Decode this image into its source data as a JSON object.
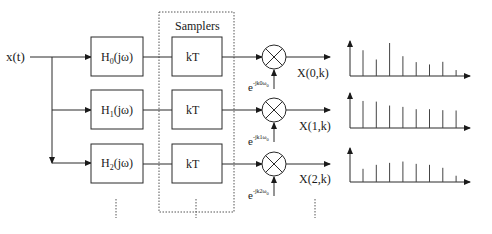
{
  "diagram": {
    "input_label": "x(t)",
    "samplers_label": "Samplers",
    "branches": [
      {
        "filter": {
          "base": "H",
          "sub": "0",
          "rest": "(jω)"
        },
        "sampler": "kT",
        "modulator": {
          "base": "e",
          "exp": "-jk0ω",
          "exp_sub": "0"
        },
        "output": "X(0,k)",
        "stems": [
          0.78,
          0.5,
          1.0,
          0.6,
          0.42,
          0.35,
          0.43,
          0.18
        ]
      },
      {
        "filter": {
          "base": "H",
          "sub": "1",
          "rest": "(jω)"
        },
        "sampler": "kT",
        "modulator": {
          "base": "e",
          "exp": "-jk1ω",
          "exp_sub": "0"
        },
        "output": "X(1,k)",
        "stems": [
          0.82,
          0.8,
          0.68,
          0.64,
          0.57,
          0.57,
          0.54,
          0.53
        ]
      },
      {
        "filter": {
          "base": "H",
          "sub": "2",
          "rest": "(jω)"
        },
        "sampler": "kT",
        "modulator": {
          "base": "e",
          "exp": "-jk2ω",
          "exp_sub": "0"
        },
        "output": "X(2,k)",
        "stems": [
          0.4,
          0.52,
          0.58,
          0.62,
          0.55,
          0.52,
          0.43,
          0.19
        ]
      }
    ],
    "continuation": "⋮",
    "colors": {
      "line": "#2a2a2a",
      "background": "#ffffff"
    }
  }
}
